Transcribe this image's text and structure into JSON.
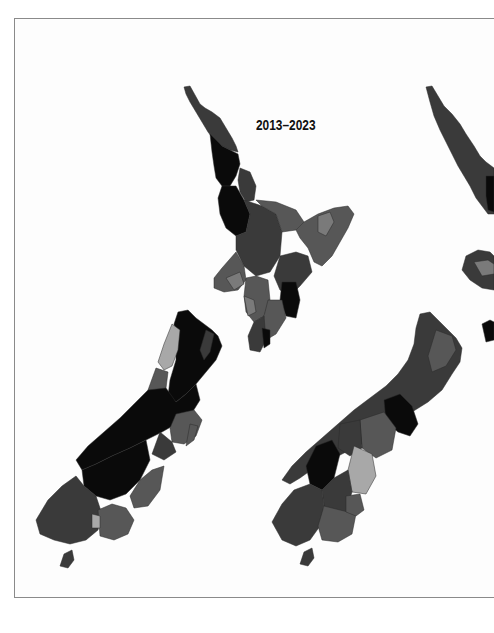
{
  "figure": {
    "panels": [
      {
        "title": "2013–2023",
        "region": "New Zealand",
        "shading": "greyscale choropleth by district"
      },
      {
        "title": "",
        "region": "New Zealand (partially visible, cropped at right edge)",
        "shading": "greyscale choropleth by district"
      }
    ],
    "palette": {
      "darkest": "#0a0a0a",
      "dark": "#3a3a3a",
      "mid": "#575757",
      "light": "#7a7a7a",
      "lightest": "#a8a8a8",
      "frame_border": "#8a8a8a",
      "background": "#ffffff"
    }
  }
}
